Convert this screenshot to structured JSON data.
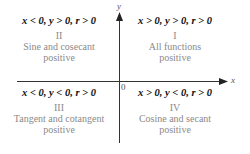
{
  "axes": {
    "x_label": "x",
    "y_label": "y",
    "origin_label": "0"
  },
  "quadrants": [
    {
      "id": "II",
      "condition": "x < 0, y > 0, r > 0",
      "numeral": "II",
      "line1": "Sine and cosecant",
      "line2": "positive"
    },
    {
      "id": "I",
      "condition": "x > 0, y > 0, r > 0",
      "numeral": "I",
      "line1": "All functions",
      "line2": "positive"
    },
    {
      "id": "III",
      "condition": "x < 0, y < 0, r > 0",
      "numeral": "III",
      "line1": "Tangent and cotangent",
      "line2": "positive"
    },
    {
      "id": "IV",
      "condition": "x > 0, y < 0, r > 0",
      "numeral": "IV",
      "line1": "Cosine and secant",
      "line2": "positive"
    }
  ]
}
